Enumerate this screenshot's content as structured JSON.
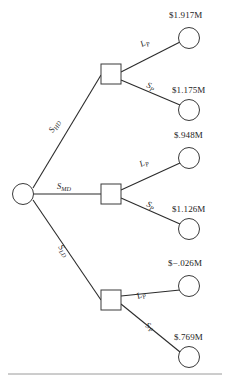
{
  "figure": {
    "type": "decision-tree",
    "root_node": {
      "shape": "circle",
      "role": "chance-node"
    },
    "trunk_branches": [
      {
        "id": "high-demand",
        "label": "S",
        "sublabel": "HD",
        "decision_node_shape": "square"
      },
      {
        "id": "medium-demand",
        "label": "S",
        "sublabel": "MD",
        "decision_node_shape": "square"
      },
      {
        "id": "low-demand",
        "label": "S",
        "sublabel": "LD",
        "decision_node_shape": "square"
      }
    ],
    "sub_branches": [
      {
        "trunk": "high-demand",
        "label": "L",
        "sublabel": "P",
        "payoff": "$1.917M"
      },
      {
        "trunk": "high-demand",
        "label": "S",
        "sublabel": "P",
        "payoff": "$1.175M"
      },
      {
        "trunk": "medium-demand",
        "label": "L",
        "sublabel": "P",
        "payoff": "$.948M"
      },
      {
        "trunk": "medium-demand",
        "label": "S",
        "sublabel": "P",
        "payoff": "$1.126M"
      },
      {
        "trunk": "low-demand",
        "label": "L",
        "sublabel": "P",
        "payoff": "$−.026M"
      },
      {
        "trunk": "low-demand",
        "label": "S",
        "sublabel": "P",
        "payoff": "$.769M"
      }
    ],
    "footer_rule": true,
    "colors": {
      "line": "#2b2b2b",
      "node_stroke": "#3a3a3a",
      "text": "#232323",
      "rule": "#9a9a9a",
      "background": "#ffffff"
    }
  }
}
